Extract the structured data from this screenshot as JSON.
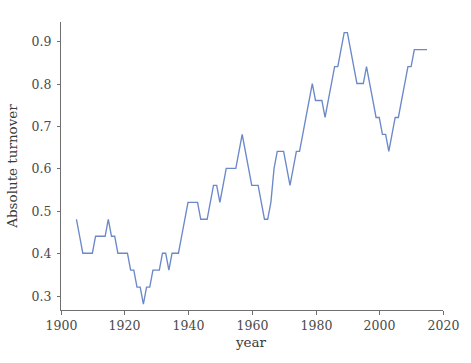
{
  "chart_data": {
    "type": "line",
    "title": "",
    "xlabel": "year",
    "ylabel": "Absolute turnover",
    "xlim": [
      1900,
      2020
    ],
    "ylim": [
      0.265,
      0.945
    ],
    "grid": false,
    "legend": false,
    "line_color": "#6b88c9",
    "x_ticks": [
      1900,
      1920,
      1940,
      1960,
      1980,
      2000,
      2020
    ],
    "x_tick_labels": [
      "1900",
      "1920",
      "1940",
      "1960",
      "1980",
      "2000",
      "2020"
    ],
    "y_ticks": [
      0.3,
      0.4,
      0.5,
      0.6,
      0.7,
      0.8,
      0.9
    ],
    "y_tick_labels": [
      "0.3",
      "0.4",
      "0.5",
      "0.6",
      "0.7",
      "0.8",
      "0.9"
    ],
    "series": [
      {
        "name": "Absolute turnover",
        "x": [
          1905,
          1906,
          1907,
          1908,
          1909,
          1910,
          1911,
          1912,
          1913,
          1914,
          1915,
          1916,
          1917,
          1918,
          1919,
          1920,
          1921,
          1922,
          1923,
          1924,
          1925,
          1926,
          1927,
          1928,
          1929,
          1930,
          1931,
          1932,
          1933,
          1934,
          1935,
          1936,
          1937,
          1938,
          1939,
          1940,
          1941,
          1942,
          1943,
          1944,
          1945,
          1946,
          1947,
          1948,
          1949,
          1950,
          1951,
          1952,
          1953,
          1954,
          1955,
          1956,
          1957,
          1958,
          1959,
          1960,
          1961,
          1962,
          1963,
          1964,
          1965,
          1966,
          1967,
          1968,
          1969,
          1970,
          1971,
          1972,
          1973,
          1974,
          1975,
          1976,
          1977,
          1978,
          1979,
          1980,
          1981,
          1982,
          1983,
          1984,
          1985,
          1986,
          1987,
          1988,
          1989,
          1990,
          1991,
          1992,
          1993,
          1994,
          1995,
          1996,
          1997,
          1998,
          1999,
          2000,
          2001,
          2002,
          2003,
          2004,
          2005,
          2006,
          2007,
          2008,
          2009,
          2010,
          2011,
          2012,
          2013,
          2014,
          2015
        ],
        "values": [
          0.48,
          0.44,
          0.4,
          0.4,
          0.4,
          0.4,
          0.44,
          0.44,
          0.44,
          0.44,
          0.48,
          0.44,
          0.44,
          0.4,
          0.4,
          0.4,
          0.4,
          0.36,
          0.36,
          0.32,
          0.32,
          0.28,
          0.32,
          0.32,
          0.36,
          0.36,
          0.36,
          0.4,
          0.4,
          0.36,
          0.4,
          0.4,
          0.4,
          0.44,
          0.48,
          0.52,
          0.52,
          0.52,
          0.52,
          0.48,
          0.48,
          0.48,
          0.52,
          0.56,
          0.56,
          0.52,
          0.56,
          0.6,
          0.6,
          0.6,
          0.6,
          0.64,
          0.68,
          0.64,
          0.6,
          0.56,
          0.56,
          0.56,
          0.52,
          0.48,
          0.48,
          0.52,
          0.6,
          0.64,
          0.64,
          0.64,
          0.6,
          0.56,
          0.6,
          0.64,
          0.64,
          0.68,
          0.72,
          0.76,
          0.8,
          0.76,
          0.76,
          0.76,
          0.72,
          0.76,
          0.8,
          0.84,
          0.84,
          0.88,
          0.92,
          0.92,
          0.88,
          0.84,
          0.8,
          0.8,
          0.8,
          0.84,
          0.8,
          0.76,
          0.72,
          0.72,
          0.68,
          0.68,
          0.64,
          0.68,
          0.72,
          0.72,
          0.76,
          0.8,
          0.84,
          0.84,
          0.88,
          0.88,
          0.88,
          0.88,
          0.88
        ]
      }
    ]
  },
  "labels": {
    "x_axis_title": "year",
    "y_axis_title": "Absolute turnover"
  }
}
